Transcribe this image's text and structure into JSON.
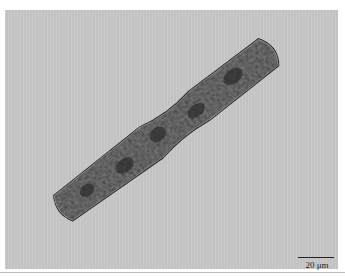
{
  "image": {
    "description": "Brightfield micrograph of an elongated, rod-shaped organism lying diagonally on a grey background",
    "background_color": "#c8c8c8",
    "organism_color": "#3a3a3a"
  },
  "scale_bar": {
    "label": "20 μm"
  }
}
